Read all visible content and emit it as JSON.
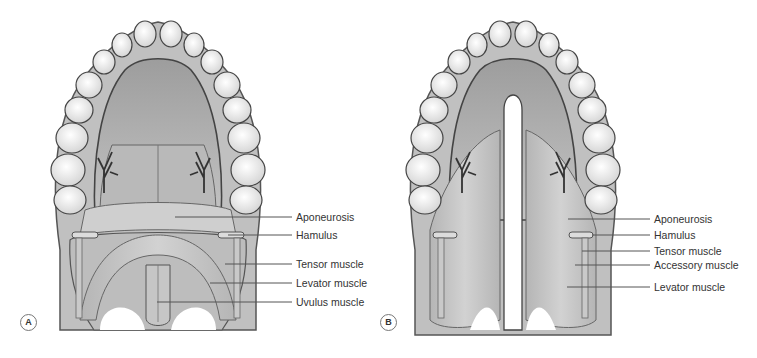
{
  "figure": {
    "panels": [
      {
        "id": "A",
        "badge": "A",
        "description": "Palate viewed from below with intact soft palate",
        "labels": [
          {
            "text": "Aponeurosis",
            "y": 217
          },
          {
            "text": "Hamulus",
            "y": 235
          },
          {
            "text": "Tensor muscle",
            "y": 264
          },
          {
            "text": "Levator muscle",
            "y": 283
          },
          {
            "text": "Uvulus muscle",
            "y": 302
          }
        ]
      },
      {
        "id": "B",
        "badge": "B",
        "description": "Palate with cleft of hard and soft palate",
        "labels": [
          {
            "text": "Aponeurosis",
            "y": 219
          },
          {
            "text": "Hamulus",
            "y": 235
          },
          {
            "text": "Tensor muscle",
            "y": 251
          },
          {
            "text": "Accessory muscle",
            "y": 265
          },
          {
            "text": "Levator muscle",
            "y": 287
          }
        ]
      }
    ],
    "colors": {
      "background": "#ffffff",
      "gum": "#b8b8b8",
      "palate": "#a9a9a9",
      "tooth": "#f2f2f2",
      "outline": "#4a4a4a",
      "leader": "#555555",
      "text": "#333333"
    }
  }
}
